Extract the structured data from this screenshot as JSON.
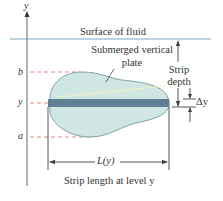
{
  "diagram": {
    "axis_label": "y",
    "surface_label": "Surface of fluid",
    "plate_label_line1": "Submerged vertical",
    "plate_label_line2": "plate",
    "strip_depth_line1": "Strip",
    "strip_depth_line2": "depth",
    "delta_y_label": "Δy",
    "level_b_label": "b",
    "level_y_label": "y",
    "level_a_label": "a",
    "length_label": "L(y)",
    "caption": "Strip length at level y"
  },
  "colors": {
    "surface_line": "#7fa8c4",
    "plate_fill": "#cfe6e3",
    "plate_stroke": "#7fa3a8",
    "strip_fill": "#5f7f93",
    "dashed_guide": "#e28c84",
    "axis": "#555555",
    "highlight": "#f4f2b8"
  }
}
